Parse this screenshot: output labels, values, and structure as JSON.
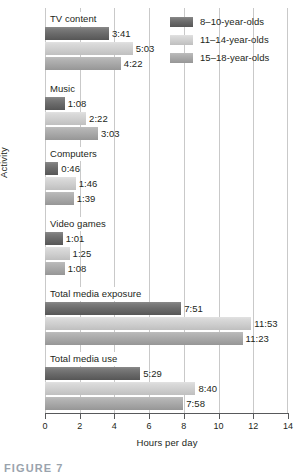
{
  "chart_data": {
    "type": "bar",
    "orientation": "horizontal",
    "title": "",
    "xlabel": "Hours per day",
    "ylabel": "Activity",
    "xlim": [
      0,
      14
    ],
    "xticks": [
      0,
      2,
      4,
      6,
      8,
      10,
      12,
      14
    ],
    "xtick_labels": [
      "0",
      "2",
      "4",
      "6",
      "8",
      "10",
      "12",
      "14"
    ],
    "grid": "vertical",
    "legend_position": "top-right",
    "categories": [
      "TV content",
      "Music",
      "Computers",
      "Video games",
      "Total media exposure",
      "Total media use"
    ],
    "series": [
      {
        "name": "8–10-year-olds",
        "color": "#6a6a6a",
        "values": [
          3.683,
          1.133,
          0.767,
          1.017,
          7.85,
          5.483
        ],
        "labels": [
          "3:41",
          "1:08",
          "0:46",
          "1:01",
          "7:51",
          "5:29"
        ]
      },
      {
        "name": "11–14-year-olds",
        "color": "#cfcfcf",
        "values": [
          5.05,
          2.367,
          1.767,
          1.417,
          11.883,
          8.667
        ],
        "labels": [
          "5:03",
          "2:22",
          "1:46",
          "1:25",
          "11:53",
          "8:40"
        ]
      },
      {
        "name": "15–18-year-olds",
        "color": "#a8a8a8",
        "values": [
          4.367,
          3.05,
          1.65,
          1.133,
          11.383,
          7.967
        ],
        "labels": [
          "4:22",
          "3:03",
          "1:39",
          "1:08",
          "11:23",
          "7:58"
        ]
      }
    ]
  },
  "legend": {
    "items": [
      {
        "label": "8–10-year-olds",
        "swatch": "dark-gray"
      },
      {
        "label": "11–14-year-olds",
        "swatch": "light-gray"
      },
      {
        "label": "15–18-year-olds",
        "swatch": "medium-gray"
      }
    ]
  },
  "axes": {
    "x_title": "Hours per day",
    "y_title": "Activity"
  },
  "caption": {
    "text": "FIGURE 7"
  }
}
